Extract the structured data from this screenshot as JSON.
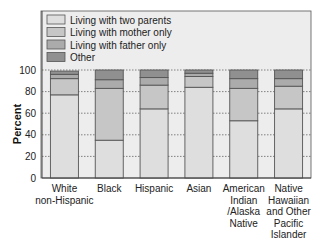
{
  "chart_data": {
    "type": "bar",
    "stacked": true,
    "title": "",
    "xlabel": "",
    "ylabel": "Percent",
    "ylim": [
      0,
      100
    ],
    "yticks": [
      0,
      20,
      40,
      60,
      80,
      100
    ],
    "grid": "horizontal dotted",
    "legend_position": "top",
    "categories": [
      [
        "White",
        "non-Hispanic"
      ],
      [
        "Black"
      ],
      [
        "Hispanic"
      ],
      [
        "Asian"
      ],
      [
        "American",
        "Indian",
        "/Alaska",
        "Native"
      ],
      [
        "Native",
        "Hawaiian",
        "and Other",
        "Pacific",
        "Islander"
      ]
    ],
    "series": [
      {
        "name": "Living with two parents",
        "color": "#dedede",
        "values": [
          77,
          35,
          64,
          84,
          53,
          64
        ]
      },
      {
        "name": "Living with mother only",
        "color": "#c6c6c6",
        "values": [
          15,
          48,
          22,
          10,
          30,
          21
        ]
      },
      {
        "name": "Living with father only",
        "color": "#ababab",
        "values": [
          4,
          8,
          7,
          3,
          9,
          7
        ]
      },
      {
        "name": "Other",
        "color": "#909090",
        "values": [
          3,
          9,
          7,
          3,
          8,
          8
        ]
      }
    ]
  }
}
